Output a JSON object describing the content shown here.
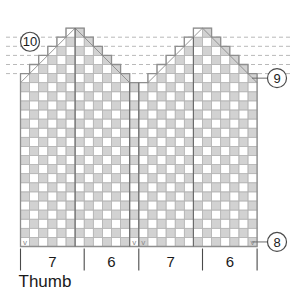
{
  "chart_data": {
    "type": "heatmap",
    "title": "",
    "grid": {
      "columns": 26,
      "rows": 24,
      "cell_px": 9.1,
      "colors": {
        "filled": "#d2d2d2",
        "empty": "#ffffff",
        "gridline": "#b5b5b5",
        "outline": "#8e8e8e",
        "divider": "#6b6b6b",
        "dashed_guide": "#b9b9b9",
        "symbol": "#8a8a8a"
      }
    },
    "legend_note": "Shaded squares = contrast color stitch; blank squares = main color stitch; diagonal slash = decrease; v = marked stitch",
    "row_markers": [
      {
        "id": "marker-10",
        "label": "10",
        "side": "left",
        "row_from_top": 2
      },
      {
        "id": "marker-9",
        "label": "9",
        "side": "right",
        "row_from_top": 6
      },
      {
        "id": "marker-8",
        "label": "8",
        "side": "right",
        "row_from_top": 24
      }
    ],
    "bottom_sections": [
      {
        "label": "7",
        "span_columns": 7
      },
      {
        "label": "6",
        "span_columns": 6
      },
      {
        "label": "7",
        "span_columns": 7
      },
      {
        "label": "6",
        "span_columns": 6
      }
    ],
    "axis_caption": "Thumb",
    "dashed_guides": [
      {
        "row_from_top": 1
      },
      {
        "row_from_top": 2
      },
      {
        "row_from_top": 3
      },
      {
        "row_from_top": 4
      },
      {
        "row_from_top": 5
      }
    ],
    "column_heights": [
      19,
      20,
      21,
      22,
      23,
      24,
      24,
      23,
      22,
      21,
      20,
      19,
      18,
      18,
      19,
      20,
      21,
      22,
      23,
      24,
      24,
      23,
      22,
      21,
      20,
      19
    ],
    "cells_filled_pattern": "checkerboard_offset_every_other_row_and_column",
    "decrease_cells": [
      {
        "col": 0,
        "row_from_bottom": 19,
        "dir": "right"
      },
      {
        "col": 1,
        "row_from_bottom": 20,
        "dir": "right"
      },
      {
        "col": 2,
        "row_from_bottom": 21,
        "dir": "right"
      },
      {
        "col": 3,
        "row_from_bottom": 22,
        "dir": "right"
      },
      {
        "col": 4,
        "row_from_bottom": 23,
        "dir": "right"
      },
      {
        "col": 5,
        "row_from_bottom": 24,
        "dir": "right"
      },
      {
        "col": 6,
        "row_from_bottom": 24,
        "dir": "left"
      },
      {
        "col": 7,
        "row_from_bottom": 23,
        "dir": "left"
      },
      {
        "col": 8,
        "row_from_bottom": 22,
        "dir": "left"
      },
      {
        "col": 9,
        "row_from_bottom": 21,
        "dir": "left"
      },
      {
        "col": 10,
        "row_from_bottom": 20,
        "dir": "left"
      },
      {
        "col": 11,
        "row_from_bottom": 19,
        "dir": "left"
      },
      {
        "col": 14,
        "row_from_bottom": 19,
        "dir": "right"
      },
      {
        "col": 15,
        "row_from_bottom": 20,
        "dir": "right"
      },
      {
        "col": 16,
        "row_from_bottom": 21,
        "dir": "right"
      },
      {
        "col": 17,
        "row_from_bottom": 22,
        "dir": "right"
      },
      {
        "col": 18,
        "row_from_bottom": 23,
        "dir": "right"
      },
      {
        "col": 19,
        "row_from_bottom": 24,
        "dir": "right"
      },
      {
        "col": 20,
        "row_from_bottom": 24,
        "dir": "left"
      },
      {
        "col": 21,
        "row_from_bottom": 23,
        "dir": "left"
      },
      {
        "col": 22,
        "row_from_bottom": 22,
        "dir": "left"
      },
      {
        "col": 23,
        "row_from_bottom": 21,
        "dir": "left"
      },
      {
        "col": 24,
        "row_from_bottom": 20,
        "dir": "left"
      },
      {
        "col": 25,
        "row_from_bottom": 19,
        "dir": "left"
      }
    ],
    "v_marks": [
      {
        "col": 0,
        "row_from_bottom": 1,
        "symbol": "v"
      },
      {
        "col": 12,
        "row_from_bottom": 1,
        "symbol": "v"
      },
      {
        "col": 13,
        "row_from_bottom": 1,
        "symbol": "v"
      },
      {
        "col": 25,
        "row_from_bottom": 1,
        "symbol": "v"
      }
    ],
    "vertical_dividers_after_column": [
      6,
      12,
      13,
      19
    ]
  }
}
